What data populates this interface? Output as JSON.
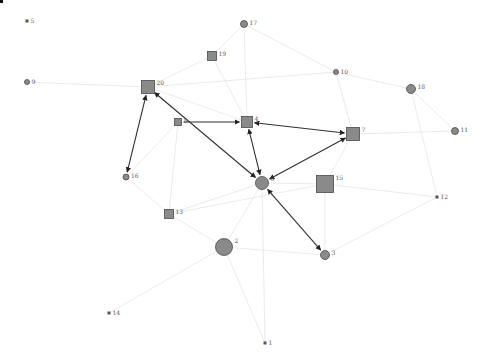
{
  "graph": {
    "title": "",
    "colors": {
      "background": "#ffffff",
      "node_fill": "#8a8a8a",
      "node_stroke": "#4a4a4a",
      "strong_edge": "#303030",
      "faint_edge": "#e4e4e4",
      "label": "#555555"
    },
    "nodes": [
      {
        "id": "1",
        "label": "1",
        "shape": "dot",
        "x": 265,
        "y": 343,
        "size": 3
      },
      {
        "id": "2",
        "label": "2",
        "shape": "circle",
        "x": 224,
        "y": 247,
        "size": 17
      },
      {
        "id": "3",
        "label": "3",
        "shape": "circle",
        "x": 325,
        "y": 255,
        "size": 9
      },
      {
        "id": "4",
        "label": "4",
        "shape": "square",
        "x": 247,
        "y": 122,
        "size": 11
      },
      {
        "id": "5",
        "label": "5",
        "shape": "dot",
        "x": 27,
        "y": 21,
        "size": 3
      },
      {
        "id": "6",
        "label": "6",
        "shape": "circle",
        "x": 262,
        "y": 183,
        "size": 13
      },
      {
        "id": "7",
        "label": "7",
        "shape": "square",
        "x": 353,
        "y": 134,
        "size": 13
      },
      {
        "id": "8",
        "label": "8",
        "shape": "square",
        "x": 178,
        "y": 122,
        "size": 7
      },
      {
        "id": "9",
        "label": "9",
        "shape": "circle",
        "x": 27,
        "y": 82,
        "size": 5
      },
      {
        "id": "10",
        "label": "10",
        "shape": "circle",
        "x": 336,
        "y": 72,
        "size": 5
      },
      {
        "id": "11",
        "label": "11",
        "shape": "circle",
        "x": 455,
        "y": 131,
        "size": 7
      },
      {
        "id": "12",
        "label": "12",
        "shape": "dot",
        "x": 437,
        "y": 197,
        "size": 3
      },
      {
        "id": "13",
        "label": "13",
        "shape": "square",
        "x": 169,
        "y": 214,
        "size": 9
      },
      {
        "id": "14",
        "label": "14",
        "shape": "dot",
        "x": 109,
        "y": 313,
        "size": 3
      },
      {
        "id": "15",
        "label": "15",
        "shape": "square",
        "x": 325,
        "y": 184,
        "size": 17
      },
      {
        "id": "16",
        "label": "16",
        "shape": "circle",
        "x": 126,
        "y": 177,
        "size": 6
      },
      {
        "id": "17",
        "label": "17",
        "shape": "circle",
        "x": 244,
        "y": 24,
        "size": 7
      },
      {
        "id": "18",
        "label": "18",
        "shape": "circle",
        "x": 411,
        "y": 89,
        "size": 9
      },
      {
        "id": "19",
        "label": "19",
        "shape": "square",
        "x": 212,
        "y": 56,
        "size": 9
      },
      {
        "id": "20",
        "label": "20",
        "shape": "square",
        "x": 148,
        "y": 87,
        "size": 13
      }
    ],
    "strong_edges": [
      {
        "from": "16",
        "to": "20",
        "arrows": "both"
      },
      {
        "from": "20",
        "to": "6",
        "arrows": "both"
      },
      {
        "from": "8",
        "to": "4",
        "arrows": "to"
      },
      {
        "from": "4",
        "to": "6",
        "arrows": "both"
      },
      {
        "from": "7",
        "to": "4",
        "arrows": "both"
      },
      {
        "from": "7",
        "to": "6",
        "arrows": "both"
      },
      {
        "from": "6",
        "to": "3",
        "arrows": "both"
      }
    ],
    "faint_edges": [
      {
        "from": "20",
        "to": "19"
      },
      {
        "from": "19",
        "to": "17"
      },
      {
        "from": "17",
        "to": "10"
      },
      {
        "from": "20",
        "to": "10"
      },
      {
        "from": "10",
        "to": "18"
      },
      {
        "from": "10",
        "to": "7"
      },
      {
        "from": "18",
        "to": "11"
      },
      {
        "from": "18",
        "to": "12"
      },
      {
        "from": "7",
        "to": "11"
      },
      {
        "from": "7",
        "to": "15"
      },
      {
        "from": "15",
        "to": "3"
      },
      {
        "from": "15",
        "to": "12"
      },
      {
        "from": "3",
        "to": "12"
      },
      {
        "from": "6",
        "to": "2"
      },
      {
        "from": "2",
        "to": "13"
      },
      {
        "from": "13",
        "to": "8"
      },
      {
        "from": "13",
        "to": "6"
      },
      {
        "from": "8",
        "to": "16"
      },
      {
        "from": "16",
        "to": "13"
      },
      {
        "from": "2",
        "to": "1"
      },
      {
        "from": "2",
        "to": "14"
      },
      {
        "from": "2",
        "to": "3"
      },
      {
        "from": "4",
        "to": "17"
      },
      {
        "from": "19",
        "to": "4"
      },
      {
        "from": "6",
        "to": "15"
      },
      {
        "from": "9",
        "to": "20"
      },
      {
        "from": "20",
        "to": "4"
      },
      {
        "from": "1",
        "to": "6"
      },
      {
        "from": "13",
        "to": "15"
      }
    ]
  }
}
